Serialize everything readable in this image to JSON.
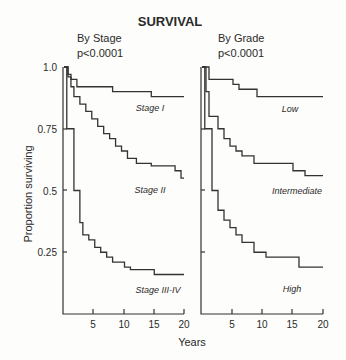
{
  "chart_data": [
    {
      "type": "line",
      "title": "SURVIVAL",
      "subtitle": "By Stage",
      "annotation": "p<0.0001",
      "xlabel": "Years",
      "ylabel": "Proportion surviving",
      "xlim": [
        0,
        20
      ],
      "ylim": [
        0,
        1.0
      ],
      "xticks": [
        5,
        10,
        15,
        20
      ],
      "yticks": [
        0.25,
        0.5,
        0.75,
        1.0
      ],
      "ytick_labels": [
        "0.25",
        "0.5",
        "0.75",
        "1.0"
      ],
      "grid": false,
      "step": true,
      "series": [
        {
          "name": "Stage I",
          "x": [
            0,
            0.5,
            1,
            2,
            8,
            14.5,
            20
          ],
          "y": [
            1.0,
            0.97,
            0.95,
            0.92,
            0.9,
            0.88,
            0.88
          ]
        },
        {
          "name": "Stage II",
          "x": [
            0,
            0.5,
            1,
            1.5,
            2.5,
            3.5,
            4.5,
            5.5,
            6.5,
            7.5,
            8.5,
            9.5,
            10.5,
            12,
            14.5,
            18.5,
            19.5,
            20
          ],
          "y": [
            1.0,
            0.96,
            0.92,
            0.88,
            0.85,
            0.82,
            0.79,
            0.76,
            0.73,
            0.71,
            0.68,
            0.66,
            0.63,
            0.61,
            0.6,
            0.58,
            0.55,
            0.55
          ]
        },
        {
          "name": "Stage III-IV",
          "x": [
            0,
            0.3,
            1.5,
            2.5,
            3.0,
            4.0,
            5.0,
            6.0,
            7.0,
            8.0,
            10.0,
            11.0,
            15.0,
            20
          ],
          "y": [
            1.0,
            0.75,
            0.5,
            0.37,
            0.32,
            0.3,
            0.27,
            0.25,
            0.23,
            0.21,
            0.19,
            0.18,
            0.16,
            0.16
          ]
        }
      ],
      "annotations": [
        {
          "text": "Stage I",
          "x": 15,
          "y": 0.8
        },
        {
          "text": "Stage II",
          "x": 15,
          "y": 0.47
        },
        {
          "text": "Stage III-IV",
          "x": 15,
          "y": 0.1
        }
      ]
    },
    {
      "type": "line",
      "subtitle": "By Grade",
      "annotation": "p<0.0001",
      "xlabel": "Years",
      "xlim": [
        0,
        20
      ],
      "ylim": [
        0,
        1.0
      ],
      "xticks": [
        5,
        10,
        15,
        20
      ],
      "yticks": [
        0.25,
        0.5,
        0.75,
        1.0
      ],
      "grid": false,
      "step": true,
      "series": [
        {
          "name": "Low",
          "x": [
            0,
            1,
            5,
            6,
            9,
            20
          ],
          "y": [
            1.0,
            0.95,
            0.93,
            0.91,
            0.88,
            0.88
          ]
        },
        {
          "name": "Intermediate",
          "x": [
            0,
            0.5,
            1,
            2.5,
            3.5,
            4.5,
            5.5,
            6.5,
            8.5,
            15,
            17,
            20
          ],
          "y": [
            1.0,
            0.9,
            0.8,
            0.75,
            0.71,
            0.68,
            0.66,
            0.64,
            0.61,
            0.58,
            0.56,
            0.56
          ]
        },
        {
          "name": "High",
          "x": [
            0,
            0.3,
            1.5,
            2.5,
            3.5,
            4.5,
            5.5,
            6.5,
            8.5,
            10.5,
            16,
            20
          ],
          "y": [
            1.0,
            0.75,
            0.5,
            0.42,
            0.38,
            0.35,
            0.32,
            0.29,
            0.25,
            0.23,
            0.19,
            0.19
          ]
        }
      ],
      "annotations": [
        {
          "text": "Low",
          "x": 13,
          "y": 0.8
        },
        {
          "text": "Intermediate",
          "x": 14,
          "y": 0.47
        },
        {
          "text": "High",
          "x": 13,
          "y": 0.09
        }
      ]
    }
  ],
  "labels": {
    "title": "SURVIVAL",
    "left_subtitle": "By Stage",
    "left_p": "p<0.0001",
    "right_subtitle": "By Grade",
    "right_p": "p<0.0001",
    "ylabel": "Proportion surviving",
    "xlabel": "Years",
    "y1": "1.0",
    "y075": "0.75",
    "y05": "0.5",
    "y025": "0.25",
    "x5": "5",
    "x10": "10",
    "x15": "15",
    "x20": "20",
    "stage1": "Stage I",
    "stage2": "Stage II",
    "stage34": "Stage III-IV",
    "low": "Low",
    "intermediate": "Intermediate",
    "high": "High"
  }
}
